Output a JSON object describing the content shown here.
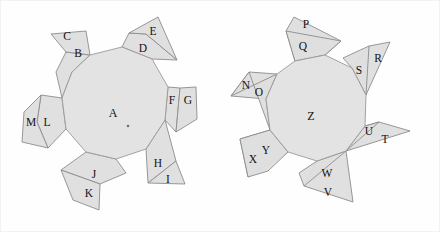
{
  "figure": {
    "background_color": "#fefefe",
    "face_fill": "#dedede",
    "face_stroke": "#8c8c8c",
    "label_color": "#15100c"
  },
  "left_net": {
    "name": "left-polygon-net",
    "center_label": "A",
    "center_label_pos": {
      "x": 113,
      "y": 117
    },
    "dot": {
      "x": 128,
      "y": 126
    },
    "core_points": "90,55 122,47 152,59 168,87 165,120 146,149 116,159 86,152 66,129 62,98 72,72",
    "faces": [
      {
        "id": "B",
        "label": "B",
        "x": 78,
        "y": 57,
        "points": "90,55 72,72 62,98 56,72 66,52"
      },
      {
        "id": "C",
        "label": "C",
        "x": 67,
        "y": 40,
        "points": "90,55 66,52 51,34 86,31"
      },
      {
        "id": "D",
        "label": "D",
        "x": 143,
        "y": 52,
        "points": "122,47 152,59 177,60 146,34 129,33"
      },
      {
        "id": "E",
        "label": "E",
        "x": 153,
        "y": 35,
        "points": "129,33 146,34 177,60 158,17"
      },
      {
        "id": "F",
        "label": "F",
        "x": 172,
        "y": 104,
        "points": "168,87 165,120 176,132 180,88"
      },
      {
        "id": "G",
        "label": "G",
        "x": 188,
        "y": 104,
        "points": "180,88 176,132 197,119 196,87"
      },
      {
        "id": "H",
        "label": "H",
        "x": 158,
        "y": 167,
        "points": "165,120 146,149 148,183 176,161"
      },
      {
        "id": "I",
        "label": "I",
        "x": 168,
        "y": 183,
        "points": "148,183 176,161 185,184"
      },
      {
        "id": "J",
        "label": "J",
        "x": 94,
        "y": 178,
        "points": "116,159 86,152 61,170 100,184 126,173"
      },
      {
        "id": "K",
        "label": "K",
        "x": 89,
        "y": 197,
        "points": "61,170 100,184 99,210 73,200"
      },
      {
        "id": "L",
        "label": "L",
        "x": 47,
        "y": 126,
        "points": "62,98 66,129 48,148 37,122 41,95"
      },
      {
        "id": "M",
        "label": "M",
        "x": 31,
        "y": 126,
        "points": "41,95 37,122 48,148 22,142 24,112"
      }
    ]
  },
  "right_net": {
    "name": "right-polygon-net",
    "center_label": "Z",
    "center_label_pos": {
      "x": 311,
      "y": 120
    },
    "core_points": "295,61 325,55 352,68 366,95 365,126 346,151 317,161 288,152 270,130 266,99 277,74"
  },
  "right_faces": [
    {
      "id": "N",
      "label": "N",
      "x": 246,
      "y": 89,
      "points": "277,74 266,99 231,96 249,72"
    },
    {
      "id": "O",
      "label": "O",
      "x": 259,
      "y": 96,
      "points": "277,74 266,99 270,130 249,72 231,96"
    },
    {
      "id": "P",
      "label": "P",
      "x": 306,
      "y": 28,
      "points": "295,61 325,55 341,41 294,17 286,31"
    },
    {
      "id": "Q",
      "label": "Q",
      "x": 303,
      "y": 50,
      "points": "286,31 295,61 325,55 341,41"
    },
    {
      "id": "R",
      "label": "R",
      "x": 378,
      "y": 62,
      "points": "352,68 366,95 390,42 369,46"
    },
    {
      "id": "S",
      "label": "S",
      "x": 359,
      "y": 74,
      "points": "352,68 366,95 369,46 343,58"
    },
    {
      "id": "T",
      "label": "T",
      "x": 385,
      "y": 143,
      "points": "365,126 346,151 410,131 379,122"
    },
    {
      "id": "U",
      "label": "U",
      "x": 369,
      "y": 135,
      "points": "365,126 346,151 379,122"
    },
    {
      "id": "V",
      "label": "V",
      "x": 328,
      "y": 196,
      "points": "317,161 346,151 353,202 304,186"
    },
    {
      "id": "W",
      "label": "W",
      "x": 327,
      "y": 177,
      "points": "317,161 346,151 304,186 299,173"
    },
    {
      "id": "X",
      "label": "X",
      "x": 253,
      "y": 163,
      "points": "288,152 270,130 240,139 248,177"
    },
    {
      "id": "Y",
      "label": "Y",
      "x": 266,
      "y": 154,
      "points": "288,152 270,130 240,139 248,177 268,171"
    }
  ]
}
